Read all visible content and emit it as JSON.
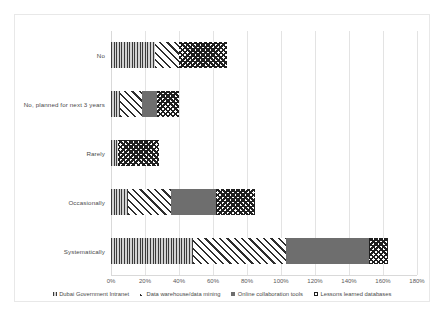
{
  "chart_data": {
    "type": "bar",
    "orientation": "horizontal",
    "stacked": true,
    "title": "",
    "xlabel": "",
    "ylabel": "",
    "xlim": [
      0,
      180
    ],
    "xticks": [
      "0%",
      "20%",
      "40%",
      "60%",
      "80%",
      "100%",
      "120%",
      "140%",
      "160%",
      "180%"
    ],
    "xtick_values": [
      0,
      20,
      40,
      60,
      80,
      100,
      120,
      140,
      160,
      180
    ],
    "grid": true,
    "legend_position": "bottom",
    "categories": [
      "No",
      "No,  planned for next 3 years",
      "Rarely",
      "Occasionally",
      "Systematically"
    ],
    "series": [
      {
        "name": "Dubai Government Intranet",
        "pattern": "vertical-stripes",
        "color": "#8c8c8c",
        "values": [
          26,
          5,
          4,
          10,
          48
        ]
      },
      {
        "name": "Data warehouse/data mining",
        "pattern": "diagonal-stripes",
        "color": "#2e2e2e",
        "values": [
          14,
          13,
          0,
          25,
          55
        ]
      },
      {
        "name": "Online collaboration tools",
        "pattern": "light-dots",
        "color": "#6e6e6e",
        "values": [
          0,
          9,
          0,
          27,
          49
        ]
      },
      {
        "name": "Lessons learned databases",
        "pattern": "checkerboard",
        "color": "#1f1f1f",
        "values": [
          28,
          13,
          24,
          23,
          11
        ]
      }
    ],
    "totals": [
      68,
      40,
      28,
      85,
      163
    ]
  },
  "legend": {
    "items": [
      {
        "label": "Dubai Government Intranet"
      },
      {
        "label": "Data warehouse/data mining"
      },
      {
        "label": "Online collaboration tools"
      },
      {
        "label": "Lessons learned databases"
      }
    ]
  }
}
